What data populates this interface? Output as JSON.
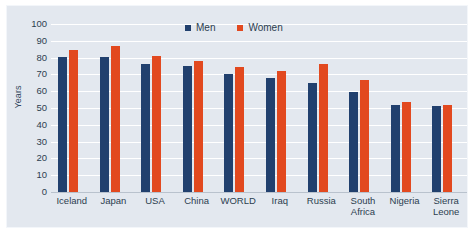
{
  "chart_data": {
    "type": "bar",
    "title": "",
    "subtitle": "",
    "xlabel": "",
    "ylabel": "Years",
    "ylim": [
      0,
      100
    ],
    "ytick_step": 10,
    "yticks": [
      100,
      90,
      80,
      70,
      60,
      50,
      40,
      30,
      20,
      10,
      0
    ],
    "grid": true,
    "legend_position": "top-center",
    "categories": [
      "Iceland",
      "Japan",
      "USA",
      "China",
      "WORLD",
      "Iraq",
      "Russia",
      "South Africa",
      "Nigeria",
      "Sierra Leone"
    ],
    "category_lines": [
      [
        "Iceland"
      ],
      [
        "Japan"
      ],
      [
        "USA"
      ],
      [
        "China"
      ],
      [
        "WORLD"
      ],
      [
        "Iraq"
      ],
      [
        "Russia"
      ],
      [
        "South",
        "Africa"
      ],
      [
        "Nigeria"
      ],
      [
        "Sierra",
        "Leone"
      ]
    ],
    "series": [
      {
        "name": "Men",
        "color": "#21406e",
        "values": [
          80.5,
          80.5,
          76,
          75,
          70.5,
          68,
          65,
          59.5,
          52,
          51
        ]
      },
      {
        "name": "Women",
        "color": "#e2491f",
        "values": [
          84.5,
          87,
          81,
          78,
          74.5,
          72,
          76,
          66.5,
          53.5,
          51.5
        ]
      }
    ]
  },
  "colors": {
    "men": "#21406e",
    "women": "#e2491f",
    "plot_background": "#e3e8ef",
    "gridline": "#ffffff",
    "axis": "#b9c2cd",
    "text": "#2c3e50"
  },
  "legend": {
    "items": [
      {
        "label": "Men",
        "color": "#21406e"
      },
      {
        "label": "Women",
        "color": "#e2491f"
      }
    ]
  }
}
